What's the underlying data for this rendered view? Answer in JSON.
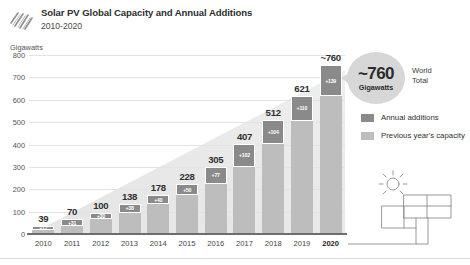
{
  "header": {
    "title": "Solar PV Global Capacity and Annual Additions",
    "subtitle": "2010-2020",
    "logo_icon": "solar-stripes-logo"
  },
  "callout": {
    "value": "~760",
    "unit": "Gigawatts",
    "world_total_line1": "World",
    "world_total_line2": "Total"
  },
  "legend": {
    "items": [
      {
        "label": "Annual additions",
        "color": "#8a8a8a",
        "swatch_icon": "legend-swatch-dark"
      },
      {
        "label": "Previous year's capacity",
        "color": "#bdbdbd",
        "swatch_icon": "legend-swatch-light"
      }
    ]
  },
  "illustration": {
    "icon": "sun-and-solar-panel-icon"
  },
  "chart_data": {
    "type": "bar",
    "title": "Solar PV Global Capacity and Annual Additions",
    "subtitle": "2010-2020",
    "xlabel": "",
    "ylabel": "Gigawatts",
    "ylim": [
      0,
      800
    ],
    "yticks": [
      0,
      100,
      200,
      300,
      400,
      500,
      600,
      700,
      800
    ],
    "ytick_labels": [
      "0",
      "100",
      "200",
      "300",
      "400",
      "500",
      "600",
      "700",
      "800"
    ],
    "grid": true,
    "legend_position": "right",
    "stacked": true,
    "categories": [
      "2010",
      "2011",
      "2012",
      "2013",
      "2014",
      "2015",
      "2016",
      "2017",
      "2018",
      "2019",
      "2020"
    ],
    "total_labels": [
      "39",
      "70",
      "100",
      "138",
      "178",
      "228",
      "305",
      "407",
      "512",
      "621",
      "~760"
    ],
    "totals": [
      39,
      70,
      100,
      138,
      178,
      228,
      305,
      407,
      512,
      621,
      760
    ],
    "series": [
      {
        "name": "Previous year's capacity",
        "color": "#bdbdbd",
        "values": [
          22,
          39,
          70,
          100,
          138,
          178,
          228,
          305,
          408,
          511,
          621
        ]
      },
      {
        "name": "Annual additions",
        "color": "#8a8a8a",
        "values": [
          17,
          31,
          30,
          38,
          40,
          50,
          77,
          102,
          104,
          110,
          139
        ],
        "labels": [
          "+17",
          "+31",
          "+30",
          "+38",
          "+40",
          "+50",
          "+77",
          "+102",
          "+104",
          "+110",
          "+139"
        ]
      }
    ]
  }
}
